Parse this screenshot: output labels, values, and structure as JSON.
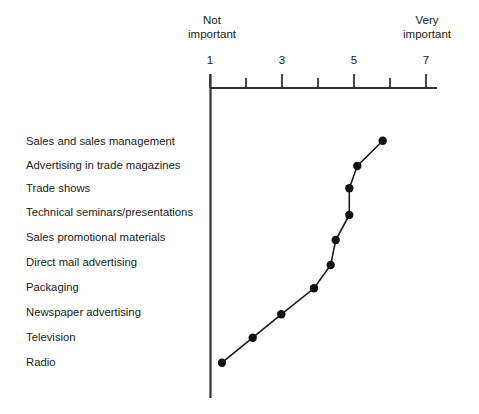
{
  "figure": {
    "axis": {
      "low_anchor_line1": "Not",
      "low_anchor_line2": "important",
      "high_anchor_line1": "Very",
      "high_anchor_line2": "important",
      "tick_labels": [
        "1",
        "3",
        "5",
        "7"
      ]
    },
    "line_color": "#1a1a1a",
    "marker_color": "#111111",
    "axis_color": "#333333"
  },
  "chart_data": {
    "type": "line",
    "orientation": "horizontal",
    "title": "",
    "xlabel": "",
    "ylabel": "",
    "xlim": [
      1,
      7
    ],
    "grid": false,
    "legend": null,
    "axis_anchor_low": "Not important",
    "axis_anchor_high": "Very important",
    "xticks": [
      1,
      2,
      3,
      4,
      5,
      6,
      7
    ],
    "xtick_labels": [
      "1",
      "",
      "3",
      "",
      "5",
      "",
      "7"
    ],
    "categories": [
      "Sales and sales management",
      "Advertising in trade magazines",
      "Trade shows",
      "Technical seminars/presentations",
      "Sales promotional materials",
      "Direct mail advertising",
      "Packaging",
      "Newspaper advertising",
      "Television",
      "Radio"
    ],
    "values": [
      5.8,
      5.1,
      4.9,
      4.9,
      4.5,
      4.35,
      3.9,
      3.0,
      2.2,
      1.35
    ],
    "points": [
      {
        "label": "Sales and sales management",
        "value": 5.8,
        "px": 382.7,
        "py": 140.7
      },
      {
        "label": "Advertising in trade magazines",
        "value": 5.1,
        "px": 357.3,
        "py": 166.0
      },
      {
        "label": "Trade shows",
        "value": 4.9,
        "px": 349.3,
        "py": 188.3
      },
      {
        "label": "Technical seminars/presentations",
        "value": 4.9,
        "px": 349.3,
        "py": 215.0
      },
      {
        "label": "Sales promotional materials",
        "value": 4.5,
        "px": 335.7,
        "py": 240.0
      },
      {
        "label": "Direct mail advertising",
        "value": 4.35,
        "px": 330.7,
        "py": 265.0
      },
      {
        "label": "Packaging",
        "value": 3.9,
        "px": 314.0,
        "py": 288.3
      },
      {
        "label": "Newspaper advertising",
        "value": 3.0,
        "px": 281.3,
        "py": 314.3
      },
      {
        "label": "Television",
        "value": 2.2,
        "px": 252.7,
        "py": 337.7
      },
      {
        "label": "Radio",
        "value": 1.35,
        "px": 222.0,
        "py": 362.7
      }
    ]
  }
}
